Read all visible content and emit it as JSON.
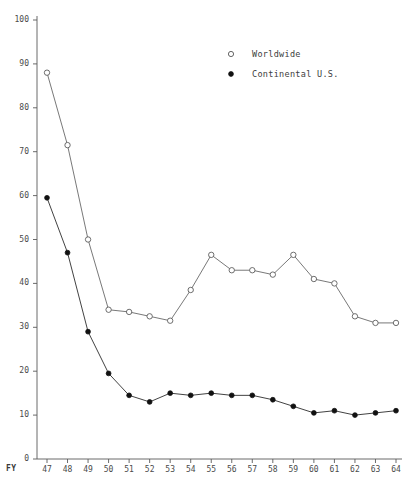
{
  "chart_data": {
    "type": "line",
    "title": "",
    "subtitle": "",
    "xlabel": "FY",
    "ylabel": "",
    "xlim": [
      46.5,
      64.5
    ],
    "ylim": [
      0,
      100
    ],
    "grid": false,
    "legend_position": "top-right",
    "x": [
      "47",
      "48",
      "49",
      "50",
      "51",
      "52",
      "53",
      "54",
      "55",
      "56",
      "57",
      "58",
      "59",
      "60",
      "61",
      "62",
      "63",
      "64"
    ],
    "x_tick_labels": [
      "47",
      "48",
      "49",
      "50",
      "51",
      "52",
      "53",
      "54",
      "55",
      "56",
      "57",
      "58",
      "59",
      "60",
      "61",
      "62",
      "63",
      "64"
    ],
    "y_tick_labels": [
      "0",
      "10",
      "20",
      "30",
      "40",
      "50",
      "60",
      "70",
      "80",
      "90",
      "100"
    ],
    "y_ticks": [
      0,
      10,
      20,
      30,
      40,
      50,
      60,
      70,
      80,
      90,
      100
    ],
    "series": [
      {
        "name": "Worldwide",
        "marker": "open-circle",
        "color": "#555555",
        "values": [
          88,
          71.5,
          50,
          34,
          33.5,
          32.5,
          31.5,
          38.5,
          46.5,
          43,
          43,
          42,
          46.5,
          41,
          40,
          32.5,
          31,
          31
        ]
      },
      {
        "name": "Continental U.S.",
        "marker": "filled-circle",
        "color": "#111111",
        "values": [
          59.5,
          47,
          29,
          19.5,
          14.5,
          13,
          15,
          14.5,
          15,
          14.5,
          14.5,
          13.5,
          12,
          10.5,
          11,
          10,
          10.5,
          11
        ]
      }
    ]
  },
  "legend": {
    "items": [
      {
        "label": "Worldwide",
        "marker": "open-circle"
      },
      {
        "label": "Continental U.S.",
        "marker": "filled-circle"
      }
    ]
  },
  "axis": {
    "x_axis_prefix": "FY"
  }
}
